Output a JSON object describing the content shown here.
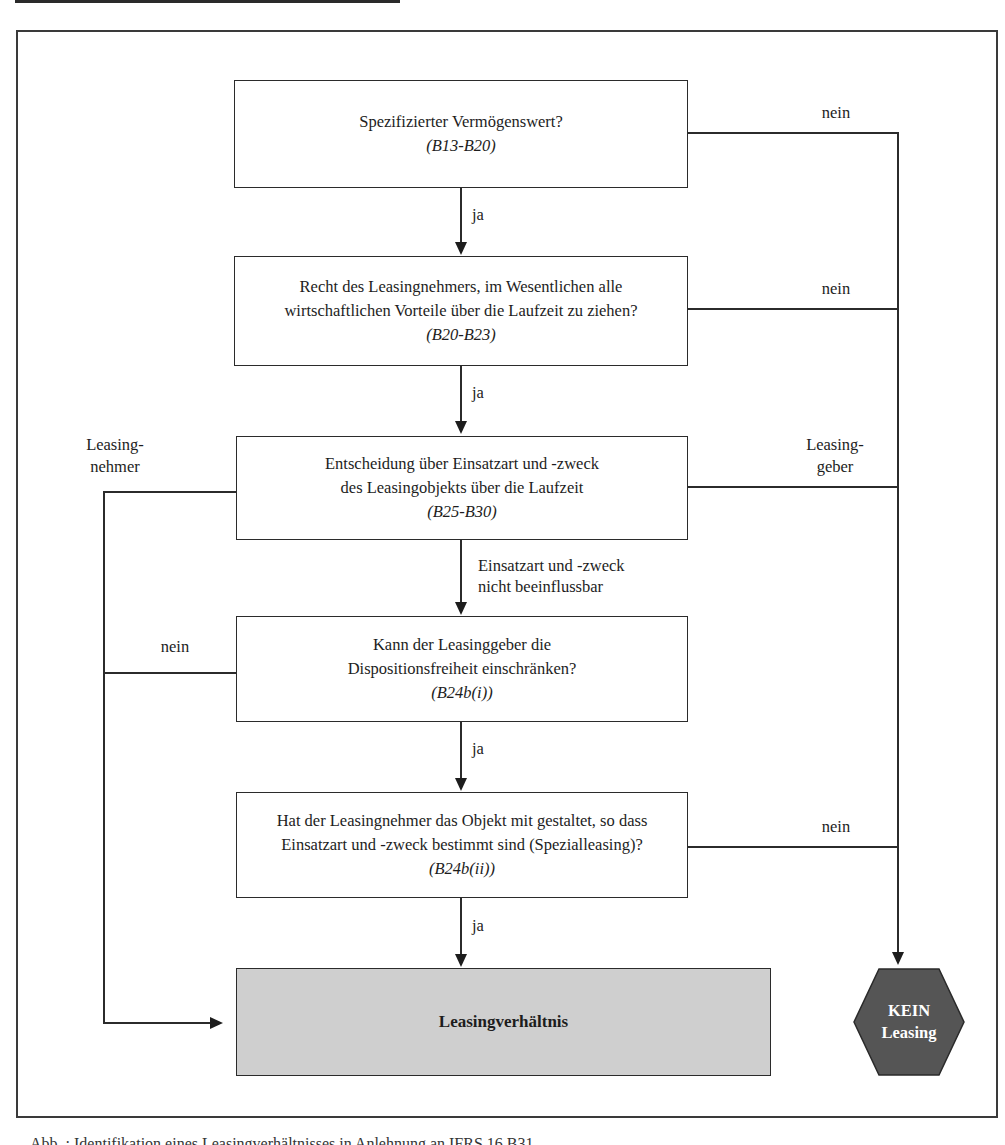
{
  "diagram": {
    "type": "flowchart",
    "boxes": [
      {
        "id": "q1",
        "text": "Spezifizierter Vermögenswert?",
        "ref": "(B13-B20)"
      },
      {
        "id": "q2",
        "line1": "Recht des Leasingnehmers, im Wesentlichen alle",
        "line2": "wirtschaftlichen Vorteile über die Laufzeit zu ziehen?",
        "ref": "(B20-B23)"
      },
      {
        "id": "q3",
        "line1": "Entscheidung über Einsatzart und -zweck",
        "line2": "des Leasingobjekts über die Laufzeit",
        "ref": "(B25-B30)"
      },
      {
        "id": "q4",
        "line1": "Kann der Leasinggeber die",
        "line2": "Dispositionsfreiheit einschränken?",
        "ref": "(B24b(i))"
      },
      {
        "id": "q5",
        "line1": "Hat der Leasingnehmer das Objekt mit gestaltet, so dass",
        "line2": "Einsatzart und -zweck bestimmt sind (Spezialleasing)?",
        "ref": "(B24b(ii))"
      }
    ],
    "outcomes": {
      "leasing": "Leasingverhältnis",
      "no_leasing_line1": "KEIN",
      "no_leasing_line2": "Leasing"
    },
    "edge_labels": {
      "ja": "ja",
      "nein": "nein",
      "leasingnehmer_line1": "Leasing-",
      "leasingnehmer_line2": "nehmer",
      "leasinggeber_line1": "Leasing-",
      "leasinggeber_line2": "geber",
      "not_influenceable_line1": "Einsatzart und -zweck",
      "not_influenceable_line2": "nicht beeinflussbar"
    },
    "colors": {
      "line": "#2b2b2b",
      "result_fill": "#cfcfcf",
      "hexagon_fill": "#555555",
      "hexagon_text": "#ffffff"
    }
  },
  "caption": "Abb. : Identifikation eines Leasingverhältnisses in Anlehnung an IFRS 16.B31"
}
